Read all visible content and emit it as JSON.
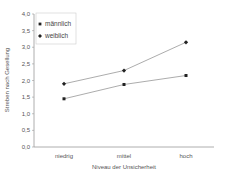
{
  "chart_data": {
    "type": "line",
    "title": "",
    "xlabel": "Niveau der Unsicherheit",
    "ylabel": "Streben nach Gesellung",
    "categories": [
      "niedrig",
      "mittel",
      "hoch"
    ],
    "series": [
      {
        "name": "männlich",
        "marker": "square",
        "values": [
          1.45,
          1.88,
          2.15
        ]
      },
      {
        "name": "weiblich",
        "marker": "diamond",
        "values": [
          1.9,
          2.3,
          3.15
        ]
      }
    ],
    "ylim": [
      0.0,
      4.0
    ],
    "yticks": [
      "0,0",
      "0,5",
      "1,0",
      "1,5",
      "2,0",
      "2,5",
      "3,0",
      "3,5",
      "4,0"
    ],
    "grid": false,
    "legend_position": "upper left"
  },
  "legend": {
    "items": [
      "männlich",
      "weiblich"
    ]
  },
  "colors": {
    "line": "#888888",
    "marker": "#222222",
    "axis": "#999999"
  }
}
